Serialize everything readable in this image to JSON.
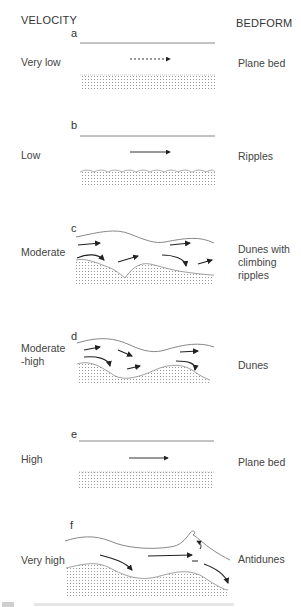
{
  "headers": {
    "velocity": "VELOCITY",
    "bedform": "BEDFORM"
  },
  "panels": [
    {
      "id": "a",
      "velocity": "Very low",
      "bedform": "Plane bed"
    },
    {
      "id": "b",
      "velocity": "Low",
      "bedform": "Ripples"
    },
    {
      "id": "c",
      "velocity": "Moderate",
      "bedform": "Dunes with climbing ripples",
      "bedform_lines": [
        "Dunes with",
        "climbing",
        "ripples"
      ]
    },
    {
      "id": "d",
      "velocity": "Moderate -high",
      "velocity_lines": [
        "Moderate",
        "-high"
      ],
      "bedform": "Dunes"
    },
    {
      "id": "e",
      "velocity": "High",
      "bedform": "Plane bed"
    },
    {
      "id": "f",
      "velocity": "Very high",
      "bedform": "Antidunes"
    }
  ],
  "colors": {
    "line": "#888888",
    "arrow": "#222222",
    "sediment_dot": "#9a9a9a"
  }
}
